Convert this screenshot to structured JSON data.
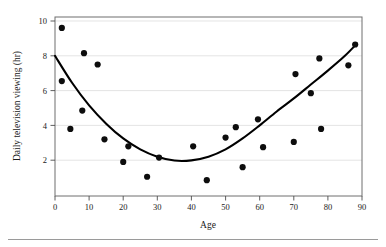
{
  "chart_data": {
    "type": "scatter",
    "title": "",
    "xlabel": "Age",
    "ylabel": "Daily television viewing (hr)",
    "xlim": [
      0,
      90
    ],
    "ylim": [
      0,
      10
    ],
    "xticks": [
      0,
      10,
      20,
      30,
      40,
      50,
      60,
      70,
      80,
      90
    ],
    "yticks": [
      2,
      4,
      6,
      8,
      10
    ],
    "grid": "horizontal",
    "legend": "none",
    "marker_color": "#0d0d0d",
    "curve_color": "#000000",
    "points": [
      {
        "x": 2,
        "y": 9.6
      },
      {
        "x": 2,
        "y": 6.55
      },
      {
        "x": 4.5,
        "y": 3.8
      },
      {
        "x": 8.5,
        "y": 8.15
      },
      {
        "x": 8,
        "y": 4.85
      },
      {
        "x": 12.5,
        "y": 7.5
      },
      {
        "x": 14.5,
        "y": 3.2
      },
      {
        "x": 20,
        "y": 1.9
      },
      {
        "x": 21.5,
        "y": 2.8
      },
      {
        "x": 27,
        "y": 1.05
      },
      {
        "x": 30.5,
        "y": 2.15
      },
      {
        "x": 40.5,
        "y": 2.8
      },
      {
        "x": 44.5,
        "y": 0.85
      },
      {
        "x": 50,
        "y": 3.3
      },
      {
        "x": 53,
        "y": 3.9
      },
      {
        "x": 55,
        "y": 1.6
      },
      {
        "x": 59.5,
        "y": 4.35
      },
      {
        "x": 61,
        "y": 2.75
      },
      {
        "x": 70,
        "y": 3.05
      },
      {
        "x": 70.5,
        "y": 6.95
      },
      {
        "x": 75,
        "y": 5.85
      },
      {
        "x": 77.5,
        "y": 7.85
      },
      {
        "x": 78,
        "y": 3.8
      },
      {
        "x": 86,
        "y": 7.45
      },
      {
        "x": 88,
        "y": 8.65
      }
    ],
    "fit_curve": {
      "description": "quadratic least-squares fit",
      "vertex": {
        "x": 37,
        "y": 1.95
      },
      "endpoints": [
        {
          "x": 0,
          "y": 8.0
        },
        {
          "x": 88.5,
          "y": 8.7
        }
      ],
      "sampled": [
        {
          "x": 0,
          "y": 8.0
        },
        {
          "x": 5,
          "y": 6.45
        },
        {
          "x": 10,
          "y": 5.15
        },
        {
          "x": 15,
          "y": 4.1
        },
        {
          "x": 20,
          "y": 3.25
        },
        {
          "x": 25,
          "y": 2.62
        },
        {
          "x": 30,
          "y": 2.2
        },
        {
          "x": 35,
          "y": 1.98
        },
        {
          "x": 40,
          "y": 1.99
        },
        {
          "x": 45,
          "y": 2.2
        },
        {
          "x": 50,
          "y": 2.62
        },
        {
          "x": 55,
          "y": 3.25
        },
        {
          "x": 60,
          "y": 4.0
        },
        {
          "x": 65,
          "y": 4.8
        },
        {
          "x": 70,
          "y": 5.55
        },
        {
          "x": 75,
          "y": 6.35
        },
        {
          "x": 80,
          "y": 7.15
        },
        {
          "x": 85,
          "y": 8.0
        },
        {
          "x": 88.5,
          "y": 8.7
        }
      ]
    }
  },
  "figure": {
    "xlabel": "Age",
    "ylabel": "Daily television viewing (hr)",
    "xticks": [
      "0",
      "10",
      "20",
      "30",
      "40",
      "50",
      "60",
      "70",
      "80",
      "90"
    ],
    "yticks": [
      "2",
      "4",
      "6",
      "8",
      "10"
    ]
  }
}
